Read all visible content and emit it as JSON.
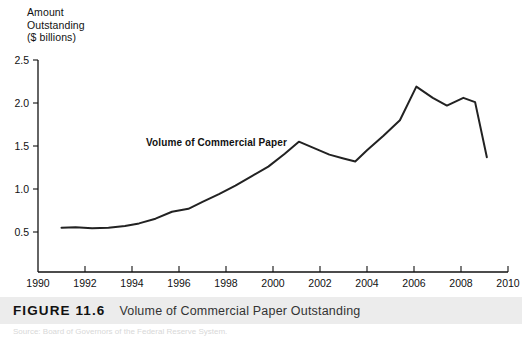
{
  "figure": {
    "number_label": "FIGURE 11.6",
    "caption": "Volume of Commercial Paper Outstanding",
    "source_line": "Source: Board of Governors of the Federal Reserve System.",
    "caption_bar_color": "#ececec"
  },
  "chart_data": {
    "type": "line",
    "title": "Volume of Commercial Paper Outstanding",
    "ylabel": "Amount\nOutstanding\n($ billions)",
    "xlabel": "",
    "grid": false,
    "legend_position": "inline-annotation",
    "annotations": [
      {
        "text": "Volume of Commercial Paper",
        "x": 1994.6,
        "y": 1.52
      }
    ],
    "line_color": "#222222",
    "line_width": 2.0,
    "xlim": [
      1990,
      2010
    ],
    "ylim": [
      0.25,
      2.5
    ],
    "xticks": [
      1990,
      1992,
      1994,
      1996,
      1998,
      2000,
      2002,
      2004,
      2006,
      2008,
      2010
    ],
    "xtick_labels": [
      "1990",
      "1992",
      "1994",
      "1996",
      "1998",
      "2000",
      "2002",
      "2004",
      "2006",
      "2008",
      "2010"
    ],
    "yticks": [
      0.5,
      1.0,
      1.5,
      2.0,
      2.5
    ],
    "ytick_labels": [
      "0.5",
      "1.0",
      "1.5",
      "2.0",
      "2.5"
    ],
    "series": [
      {
        "name": "Volume of Commercial Paper",
        "x": [
          1991.0,
          1991.6,
          1992.3,
          1993.0,
          1993.7,
          1994.3,
          1995.0,
          1995.7,
          1996.4,
          1997.0,
          1997.7,
          1998.4,
          1999.1,
          1999.8,
          2000.5,
          2001.1,
          2001.8,
          2002.4,
          2003.0,
          2003.5,
          2004.0,
          2004.7,
          2005.4,
          2006.1,
          2006.8,
          2007.4,
          2008.1,
          2008.6,
          2009.1
        ],
        "values": [
          0.55,
          0.555,
          0.545,
          0.55,
          0.57,
          0.6,
          0.655,
          0.735,
          0.77,
          0.85,
          0.94,
          1.04,
          1.15,
          1.26,
          1.41,
          1.55,
          1.47,
          1.4,
          1.355,
          1.32,
          1.45,
          1.62,
          1.8,
          2.19,
          2.06,
          1.97,
          2.06,
          2.01,
          1.37
        ]
      }
    ]
  }
}
